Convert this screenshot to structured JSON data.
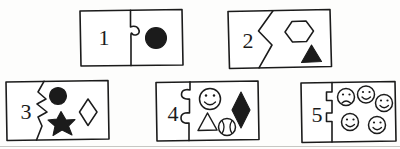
{
  "page": {
    "background_color": "#fdfdfc",
    "ink_color": "#1b1b1b",
    "width": 400,
    "height": 149
  },
  "tiles": [
    {
      "id": "tile-1",
      "numeral": "1",
      "count": 1,
      "divider_style": "jigsaw-single-tab",
      "shapes": [
        {
          "name": "circle-shape",
          "kind": "circle",
          "fill": "filled"
        }
      ]
    },
    {
      "id": "tile-2",
      "numeral": "2",
      "count": 2,
      "divider_style": "zigzag",
      "shapes": [
        {
          "name": "hexagon-shape",
          "kind": "hexagon",
          "fill": "outline"
        },
        {
          "name": "triangle-shape",
          "kind": "triangle",
          "fill": "filled"
        }
      ]
    },
    {
      "id": "tile-3",
      "numeral": "3",
      "count": 3,
      "divider_style": "zigzag",
      "shapes": [
        {
          "name": "circle-shape",
          "kind": "circle",
          "fill": "filled"
        },
        {
          "name": "star-shape",
          "kind": "star",
          "fill": "filled"
        },
        {
          "name": "diamond-shape",
          "kind": "diamond",
          "fill": "outline"
        }
      ]
    },
    {
      "id": "tile-4",
      "numeral": "4",
      "count": 4,
      "divider_style": "jigsaw-double-tab",
      "shapes": [
        {
          "name": "smiley-face-shape",
          "kind": "smiley",
          "fill": "outline"
        },
        {
          "name": "diamond-shape",
          "kind": "diamond",
          "fill": "filled"
        },
        {
          "name": "triangle-shape",
          "kind": "triangle",
          "fill": "outline"
        },
        {
          "name": "ball-shape",
          "kind": "ball",
          "fill": "outline"
        }
      ]
    },
    {
      "id": "tile-5",
      "numeral": "5",
      "count": 5,
      "divider_style": "jigsaw-square-tab",
      "shapes": [
        {
          "name": "frowny-face-shape",
          "kind": "frowny",
          "fill": "outline"
        },
        {
          "name": "smiley-face-shape",
          "kind": "smiley",
          "fill": "outline"
        },
        {
          "name": "smiley-face-shape",
          "kind": "smiley",
          "fill": "outline"
        },
        {
          "name": "smiley-face-shape",
          "kind": "smiley",
          "fill": "outline"
        },
        {
          "name": "smiley-face-shape",
          "kind": "smiley",
          "fill": "outline"
        }
      ]
    }
  ]
}
